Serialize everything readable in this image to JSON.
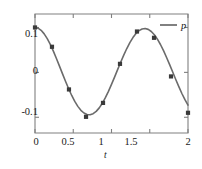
{
  "chart_data": {
    "type": "line",
    "title": "",
    "xlabel": "t",
    "ylabel": "",
    "xlim": [
      0,
      2
    ],
    "ylim": [
      -0.135,
      0.13
    ],
    "grid": false,
    "legend_position": "top-right",
    "line_color": "#6b6b6b",
    "marker_color": "#3a3a3a",
    "marker_style": "square",
    "axis_color": "#808080",
    "xticks": [
      0,
      0.5,
      1,
      1.5,
      2
    ],
    "xtick_labels": [
      "0",
      "0.5",
      "1",
      "1.5",
      "2"
    ],
    "yticks": [
      0.1,
      0,
      -0.1
    ],
    "ytick_labels": [
      "0.1",
      "0",
      "-0.1"
    ],
    "series": [
      {
        "name": "p",
        "legend_label": "p",
        "x": [
          0,
          0.222,
          0.444,
          0.667,
          0.889,
          1.111,
          1.333,
          1.556,
          1.778,
          2.0
        ],
        "values": [
          0.1,
          0.057,
          -0.038,
          -0.099,
          -0.068,
          0.019,
          0.091,
          0.077,
          -0.009,
          -0.09
        ]
      }
    ],
    "curve": {
      "description": "smooth cosine through markers",
      "formula_amplitude": 0.1,
      "formula_frequency": 4.5,
      "x": [
        0,
        0.04,
        0.08,
        0.12,
        0.16,
        0.2,
        0.24,
        0.28,
        0.32,
        0.36,
        0.4,
        0.44,
        0.48,
        0.52,
        0.56,
        0.6,
        0.64,
        0.68,
        0.72,
        0.76,
        0.8,
        0.84,
        0.88,
        0.92,
        0.96,
        1.0,
        1.04,
        1.08,
        1.12,
        1.16,
        1.2,
        1.24,
        1.28,
        1.32,
        1.36,
        1.4,
        1.44,
        1.48,
        1.52,
        1.56,
        1.6,
        1.64,
        1.68,
        1.72,
        1.76,
        1.8,
        1.84,
        1.88,
        1.92,
        1.96,
        2.0
      ],
      "y": [
        0.1,
        0.0984,
        0.0936,
        0.0857,
        0.0751,
        0.0622,
        0.0473,
        0.031,
        0.014,
        -0.0033,
        -0.0203,
        -0.0365,
        -0.0514,
        -0.0646,
        -0.0757,
        -0.0844,
        -0.0905,
        -0.0939,
        -0.0944,
        -0.092,
        -0.0869,
        -0.0791,
        -0.0688,
        -0.0564,
        -0.0423,
        -0.0268,
        -0.0105,
        0.0061,
        0.0226,
        0.0384,
        0.0531,
        0.0663,
        0.0775,
        0.0865,
        0.093,
        0.0967,
        0.0977,
        0.0958,
        0.0911,
        0.0838,
        0.074,
        0.0621,
        0.0483,
        0.0332,
        0.0172,
        0.0007,
        -0.0158,
        -0.0318,
        -0.047,
        -0.0609,
        -0.073
      ]
    }
  },
  "legend": {
    "label": "p",
    "swatch": "line-swatch"
  },
  "axes": {
    "x_title": "t",
    "x_tick_labels": [
      "0",
      "0.5",
      "1",
      "1.5",
      "2"
    ],
    "y_tick_labels": [
      "0.1",
      "0",
      "-0.1"
    ]
  }
}
